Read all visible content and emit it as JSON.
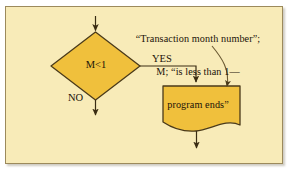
{
  "figure": {
    "background_color": "#f8ebb8",
    "frame_border_color": "#9c8a5c",
    "shape_fill_color": "#f0c03c",
    "shape_outline_color": "#4a3a1a",
    "connector_color": "#4a3a1a",
    "text_color": "#1a1208"
  },
  "annotation": {
    "name": "transaction-month-annotation",
    "lines": [
      "“Transaction month number”;",
      "M; “is less than 1—",
      "program ends”"
    ]
  },
  "nodes": {
    "decision": {
      "name": "decision-diamond",
      "label": "M<1",
      "shape": "diamond"
    },
    "document": {
      "name": "document-shape",
      "label": "",
      "shape": "document"
    }
  },
  "connectors": {
    "entry_arrow": "arrow-into-decision",
    "yes_branch": {
      "name": "yes-branch",
      "label": "YES"
    },
    "no_branch": {
      "name": "no-branch",
      "label": "NO"
    },
    "document_exit": "arrow-out-of-document",
    "annotation_pointer": "curved-annotation-arrow"
  }
}
